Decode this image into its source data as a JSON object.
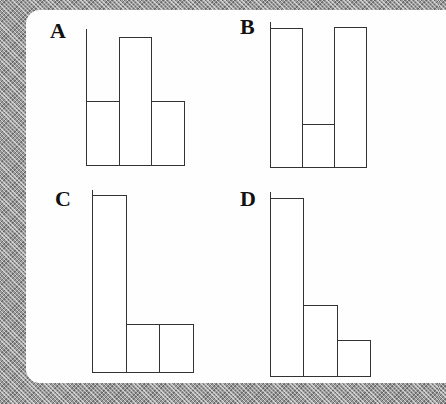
{
  "chart_data": [
    {
      "type": "bar",
      "title": "A",
      "categories": [
        "1",
        "2",
        "3"
      ],
      "values": [
        64,
        128,
        64
      ],
      "axes": "none",
      "grid": false
    },
    {
      "type": "bar",
      "title": "B",
      "categories": [
        "1",
        "2",
        "3"
      ],
      "values": [
        139,
        43,
        140
      ],
      "axes": "none",
      "grid": false
    },
    {
      "type": "bar",
      "title": "C",
      "categories": [
        "1",
        "2",
        "3"
      ],
      "values": [
        177,
        48,
        48
      ],
      "axes": "none",
      "grid": false
    },
    {
      "type": "bar",
      "title": "D",
      "categories": [
        "1",
        "2",
        "3"
      ],
      "values": [
        178,
        71,
        36
      ],
      "axes": "none",
      "grid": false
    }
  ],
  "panels": [
    {
      "label": "A",
      "left": 86,
      "bottom": 165,
      "axis_top": 29,
      "bar_width": 32.5
    },
    {
      "label": "B",
      "left": 270,
      "bottom": 167,
      "axis_top": 22,
      "bar_width": 32
    },
    {
      "label": "C",
      "left": 92,
      "bottom": 372,
      "axis_top": 190,
      "bar_width": 33.5
    },
    {
      "label": "D",
      "left": 270,
      "bottom": 376,
      "axis_top": 192,
      "bar_width": 33.3
    }
  ]
}
